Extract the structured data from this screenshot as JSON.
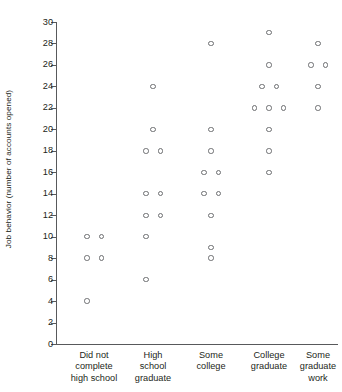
{
  "chart_data": {
    "type": "scatter",
    "title": "",
    "subtitle": "",
    "xlabel": "",
    "ylabel": "Job behavior (number of accounts opened)",
    "ylim": [
      0,
      30
    ],
    "ytick_step": 2,
    "yticks": [
      0,
      2,
      4,
      6,
      8,
      10,
      12,
      14,
      16,
      18,
      20,
      22,
      24,
      26,
      28,
      30
    ],
    "grid": false,
    "legend": "none",
    "marker": "open-circle",
    "marker_fill": "#ffffff",
    "marker_stroke": "#6d6e71",
    "axis_color": "#58595b",
    "text_color": "#231f20",
    "background": "#ffffff",
    "categories": [
      "Did not\ncomplete\nhigh school",
      "High\nschool\ngraduate",
      "Some\ncollege",
      "College\ngraduate",
      "Some\ngraduate\nwork"
    ],
    "groups": [
      {
        "category": "Did not complete high school",
        "label": "Did not\ncomplete\nhigh school",
        "values": [
          10,
          10,
          8,
          8,
          4
        ],
        "points": [
          {
            "value": 10,
            "jitter": -1
          },
          {
            "value": 10,
            "jitter": 1
          },
          {
            "value": 8,
            "jitter": -1
          },
          {
            "value": 8,
            "jitter": 1
          },
          {
            "value": 4,
            "jitter": -1
          }
        ]
      },
      {
        "category": "High school graduate",
        "label": "High\nschool\ngraduate",
        "values": [
          24,
          20,
          18,
          18,
          14,
          14,
          12,
          12,
          10,
          6
        ],
        "points": [
          {
            "value": 24,
            "jitter": 0
          },
          {
            "value": 20,
            "jitter": 0
          },
          {
            "value": 18,
            "jitter": -1
          },
          {
            "value": 18,
            "jitter": 1
          },
          {
            "value": 14,
            "jitter": -1
          },
          {
            "value": 14,
            "jitter": 1
          },
          {
            "value": 12,
            "jitter": -1
          },
          {
            "value": 12,
            "jitter": 1
          },
          {
            "value": 10,
            "jitter": -1
          },
          {
            "value": 6,
            "jitter": -1
          }
        ]
      },
      {
        "category": "Some college",
        "label": "Some\ncollege",
        "values": [
          28,
          20,
          18,
          16,
          16,
          14,
          14,
          12,
          9,
          8
        ],
        "points": [
          {
            "value": 28,
            "jitter": 0
          },
          {
            "value": 20,
            "jitter": 0
          },
          {
            "value": 18,
            "jitter": 0
          },
          {
            "value": 16,
            "jitter": -1
          },
          {
            "value": 16,
            "jitter": 1
          },
          {
            "value": 14,
            "jitter": -1
          },
          {
            "value": 14,
            "jitter": 1
          },
          {
            "value": 12,
            "jitter": 0
          },
          {
            "value": 9,
            "jitter": 0
          },
          {
            "value": 8,
            "jitter": 0
          }
        ]
      },
      {
        "category": "College graduate",
        "label": "College\ngraduate",
        "values": [
          29,
          26,
          24,
          24,
          22,
          22,
          22,
          20,
          18,
          16
        ],
        "points": [
          {
            "value": 29,
            "jitter": 0
          },
          {
            "value": 26,
            "jitter": 0
          },
          {
            "value": 24,
            "jitter": -1
          },
          {
            "value": 24,
            "jitter": 1
          },
          {
            "value": 22,
            "jitter": -2
          },
          {
            "value": 22,
            "jitter": 0
          },
          {
            "value": 22,
            "jitter": 2
          },
          {
            "value": 20,
            "jitter": 0
          },
          {
            "value": 18,
            "jitter": 0
          },
          {
            "value": 16,
            "jitter": 0
          }
        ]
      },
      {
        "category": "Some graduate work",
        "label": "Some\ngraduate\nwork",
        "values": [
          28,
          26,
          26,
          24,
          22
        ],
        "points": [
          {
            "value": 28,
            "jitter": 0
          },
          {
            "value": 26,
            "jitter": -1
          },
          {
            "value": 26,
            "jitter": 1
          },
          {
            "value": 24,
            "jitter": 0
          },
          {
            "value": 22,
            "jitter": 0
          }
        ]
      }
    ]
  }
}
